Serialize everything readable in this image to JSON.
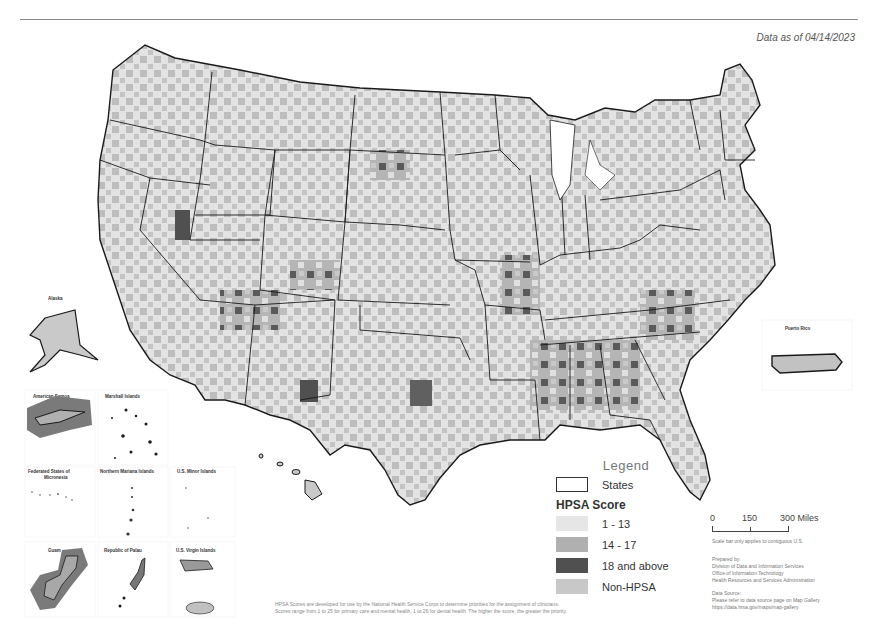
{
  "header": {
    "data_date": "Data as of 04/14/2023"
  },
  "legend": {
    "title": "Legend",
    "states_label": "States",
    "score_heading": "HPSA Score",
    "items": [
      {
        "label": "1 - 13",
        "color": "#e6e6e6"
      },
      {
        "label": "14 - 17",
        "color": "#b0b0b0"
      },
      {
        "label": "18 and above",
        "color": "#505050"
      },
      {
        "label": "Non-HPSA",
        "color": "#c8c8c8"
      }
    ]
  },
  "scale_bar": {
    "tick_0": "0",
    "tick_mid": "150",
    "tick_end": "300 Miles",
    "note": "Scale bar only applies to contiguous U.S."
  },
  "credits": {
    "prepared_by_heading": "Prepared by:",
    "prepared_by_lines": [
      "Division of Data and Information Services",
      "Office of Information Technology",
      "Health Resources and Services Administration"
    ],
    "data_source_heading": "Data Source:",
    "data_source_lines": [
      "Please refer to data source page on Map Gallery",
      "https://data.hrsa.gov/maps/map-gallery"
    ]
  },
  "footnote": {
    "line1": "HPSA Scores are developed for use by the National Health Service Corps to determine priorities for the assignment of clinicians.",
    "line2": "Scores range from 1 to 25 for primary care and mental health, 1 to 26 for dental health. The higher the score, the greater the priority."
  },
  "insets": {
    "alaska": "Alaska",
    "hawaii": "",
    "puerto_rico": "Puerto Rico",
    "american_samoa": "American Samoa",
    "marshall_islands": "Marshall Islands",
    "micronesia": "Federated States of Micronesia",
    "northern_mariana": "Northern Mariana Islands",
    "us_minor": "U.S. Minor Islands",
    "guam": "Guam",
    "palau": "Republic of Palau",
    "virgin_islands": "U.S. Virgin Islands"
  },
  "colors": {
    "low": "#e6e6e6",
    "mid": "#b0b0b0",
    "high": "#505050",
    "non_hpsa": "#c8c8c8",
    "border": "#1a1a1a"
  }
}
